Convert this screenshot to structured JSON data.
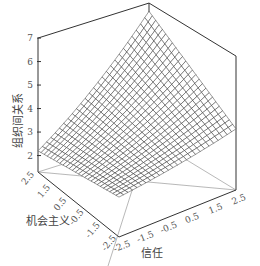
{
  "chart_data": {
    "type": "surface3d",
    "title": "",
    "xlabel": "信任",
    "ylabel": "机会主义",
    "zlabel": "组织间关系",
    "x_ticks": [
      "-2.5",
      "-1.5",
      "-0.5",
      "0.5",
      "1.5",
      "2.5"
    ],
    "y_ticks": [
      "2.5",
      "1.5",
      "0.5",
      "-0.5",
      "-1.5",
      "-2.5"
    ],
    "z_ticks": [
      "2",
      "3",
      "4",
      "5",
      "6",
      "7"
    ],
    "xlim": [
      -2.5,
      2.5
    ],
    "ylim": [
      -2.5,
      2.5
    ],
    "zlim": [
      1.3,
      7
    ],
    "grid": true,
    "mesh_resolution": 26,
    "corner_values": {
      "trust_-2.5_opportunism_-2.5": 3.0,
      "trust_2.5_opportunism_-2.5": 3.9,
      "trust_-2.5_opportunism_2.5": 2.2,
      "trust_2.5_opportunism_2.5": 6.4
    },
    "surface_description": "Interaction surface: 组织间关系 rises with 信任, most steeply when 机会主义 is high; minimum near low 信任 / high 机会主义 (~2), maximum at high 信任 / high 机会主义 (~6.4)"
  },
  "labels": {
    "z_axis_title": "组织间关系",
    "y_axis_title": "机会主义",
    "x_axis_title": "信任"
  }
}
